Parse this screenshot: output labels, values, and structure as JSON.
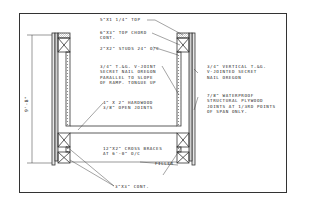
{
  "drawing": {
    "type": "architectural section detail",
    "subject": "ramp / bridge wall and floor section",
    "dimension_label": "9'-8\"",
    "labels": {
      "top_rail": "5\"x1 1/4\" TOP",
      "top_chord": "6\"x3\" TOP CHORD\nCONT.",
      "studs": "2\"x2\" STUDS 24\" o/c",
      "interior_sheathing": "3/4\" T.&G. V-JOINT\nSECRET NAIL OREGON\nPARALLEL TO SLOPE\nOF RAMP. TONGUE UP",
      "floor": "4\" x 2\" HARDWOOD\n3/8\" OPEN JOINTS",
      "cross_braces": "12\"x2\" CROSS BRACES\nAT 6'-0\" o/c",
      "filler": "FILLER",
      "bottom_chord": "3\"x3\" CONT.",
      "exterior_sheathing": "3/4\" VERTICAL T.&G.\nV-JOINTED SECRET\nNAIL OREGON",
      "plywood": "7/8\" WATERPROOF\nSTRUCTURAL PLYWOOD\nJOINTS AT 1/3rd POINTS\nOF SPAN ONLY."
    },
    "colors": {
      "line": "#333333",
      "background": "#ffffff",
      "hatch": "#999999"
    }
  }
}
